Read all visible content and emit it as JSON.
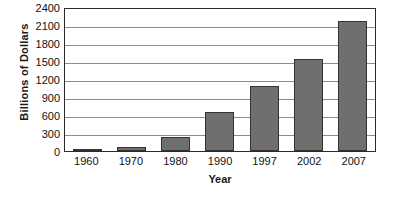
{
  "chart_data": {
    "type": "bar",
    "title": "",
    "xlabel": "Year",
    "ylabel": "Billions of Dollars",
    "categories": [
      "1960",
      "1970",
      "1980",
      "1990",
      "1997",
      "2002",
      "2007"
    ],
    "values": [
      20,
      60,
      240,
      650,
      1080,
      1540,
      2170
    ],
    "ylim": [
      0,
      2400
    ],
    "yticks": [
      0,
      300,
      600,
      900,
      1200,
      1500,
      1800,
      2100,
      2400
    ],
    "ytick_labels": [
      "0",
      "300",
      "600",
      "900",
      "1200",
      "1500",
      "1800",
      "2100",
      "2400"
    ],
    "grid": true,
    "legend": "none",
    "series": [
      {
        "name": "Billions of Dollars",
        "values": [
          20,
          60,
          240,
          650,
          1080,
          1540,
          2170
        ]
      }
    ],
    "bar_color": "#6f6f6f",
    "bar_edge_color": "#333333",
    "axis_color": "#2b2b2b",
    "grid_color": "#8d8d8d",
    "background": "#ffffff"
  }
}
